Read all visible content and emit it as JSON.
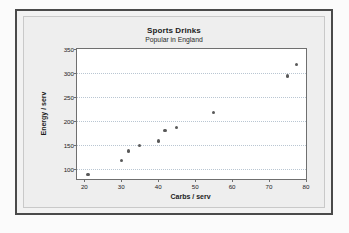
{
  "chart_data": {
    "type": "scatter",
    "title": "Sports Drinks",
    "subtitle": "Popular in England",
    "xlabel": "Carbs / serv",
    "ylabel": "Energy / serv",
    "xlim": [
      18,
      80
    ],
    "ylim": [
      80,
      350
    ],
    "xticks": [
      20,
      30,
      40,
      50,
      60,
      70,
      80
    ],
    "yticks": [
      100,
      150,
      200,
      250,
      300,
      350
    ],
    "grid": "horizontal-dotted",
    "legend": "none",
    "marker_color": "#595959",
    "points": [
      {
        "x": 21,
        "y": 90
      },
      {
        "x": 30,
        "y": 118
      },
      {
        "x": 32,
        "y": 138
      },
      {
        "x": 35,
        "y": 149
      },
      {
        "x": 40,
        "y": 159
      },
      {
        "x": 41.8,
        "y": 181
      },
      {
        "x": 45,
        "y": 187
      },
      {
        "x": 55,
        "y": 218
      },
      {
        "x": 75,
        "y": 294
      },
      {
        "x": 77.5,
        "y": 317
      }
    ]
  },
  "frame": {
    "border_color": "#4a4a4a",
    "background": "#f2f2f2"
  }
}
